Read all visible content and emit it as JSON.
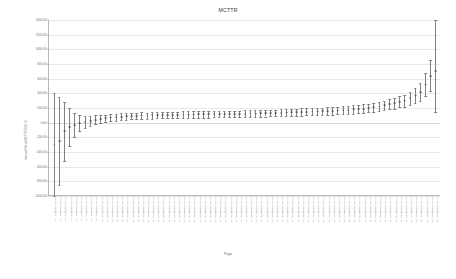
{
  "chart_data": {
    "type": "scatter",
    "title": "MCTTR",
    "xlabel": "Page",
    "ylabel": "Interval Plot of MCTTR 95% CI",
    "ylim": [
      -1000,
      1400
    ],
    "yticks": [
      "1400.00",
      "1200.00",
      "1000.00",
      "800.00",
      "600.00",
      "400.00",
      "200.00",
      "0.00",
      "-200.00",
      "-400.00",
      "-600.00",
      "-800.00",
      "-1000.00"
    ],
    "grid": true,
    "legend": "none",
    "categories": [
      "part 1 assembly station",
      "part 2 assembly station",
      "part 3 assembly station",
      "part 4 assembly station",
      "part 5 assembly station",
      "part 6 assembly station",
      "part 7 assembly station",
      "part 8 assembly station",
      "part 9 assembly station",
      "part 10 assembly station",
      "part 11 assembly station",
      "part 12 assembly station",
      "part 13 assembly station",
      "part 14 assembly station",
      "part 15 assembly station",
      "part 16 assembly station",
      "part 17 assembly station",
      "part 18 assembly station",
      "part 19 assembly station",
      "part 20 assembly station",
      "part 21 assembly station",
      "part 22 assembly station",
      "part 23 assembly station",
      "part 24 assembly station",
      "part 25 assembly station",
      "part 26 assembly station",
      "part 27 assembly station",
      "part 28 assembly station",
      "part 29 assembly station",
      "part 30 assembly station",
      "part 31 assembly station",
      "part 32 assembly station",
      "part 33 assembly station",
      "part 34 assembly station",
      "part 35 assembly station",
      "part 36 assembly station",
      "part 37 assembly station",
      "part 38 assembly station",
      "part 39 assembly station",
      "part 40 assembly station",
      "part 41 assembly station",
      "part 42 assembly station",
      "part 43 assembly station",
      "part 44 assembly station",
      "part 45 assembly station",
      "part 46 assembly station",
      "part 47 assembly station",
      "part 48 assembly station",
      "part 49 assembly station",
      "part 50 assembly station",
      "part 51 assembly station",
      "part 52 assembly station",
      "part 53 assembly station",
      "part 54 assembly station",
      "part 55 assembly station",
      "part 56 assembly station",
      "part 57 assembly station",
      "part 58 assembly station",
      "part 59 assembly station",
      "part 60 assembly station",
      "part 61 assembly station",
      "part 62 assembly station",
      "part 63 assembly station",
      "part 64 assembly station",
      "part 65 assembly station",
      "part 66 assembly station",
      "part 67 assembly station",
      "part 68 assembly station",
      "part 69 assembly station",
      "part 70 assembly station",
      "part 71 assembly station",
      "part 72 assembly station",
      "part 73 assembly station",
      "part 74 assembly station",
      "part 75 assembly station"
    ],
    "values": [
      -300,
      -250,
      -120,
      -60,
      -30,
      -10,
      10,
      25,
      40,
      50,
      60,
      70,
      75,
      80,
      85,
      90,
      90,
      95,
      95,
      100,
      100,
      100,
      105,
      105,
      105,
      110,
      110,
      110,
      112,
      112,
      115,
      115,
      115,
      118,
      118,
      120,
      120,
      122,
      125,
      125,
      128,
      130,
      130,
      132,
      135,
      138,
      140,
      142,
      145,
      148,
      150,
      152,
      155,
      158,
      160,
      165,
      170,
      175,
      180,
      185,
      190,
      200,
      210,
      220,
      235,
      250,
      265,
      285,
      300,
      330,
      370,
      420,
      520,
      640,
      700
    ],
    "lower": [
      -1000,
      -850,
      -520,
      -320,
      -190,
      -120,
      -70,
      -40,
      -20,
      -5,
      10,
      20,
      28,
      34,
      40,
      45,
      46,
      50,
      52,
      56,
      58,
      58,
      62,
      62,
      63,
      66,
      66,
      67,
      68,
      69,
      70,
      71,
      72,
      74,
      74,
      76,
      77,
      78,
      80,
      80,
      82,
      84,
      85,
      86,
      88,
      90,
      92,
      94,
      96,
      98,
      100,
      102,
      104,
      106,
      108,
      112,
      116,
      120,
      124,
      128,
      132,
      140,
      148,
      156,
      168,
      180,
      192,
      208,
      220,
      240,
      270,
      300,
      360,
      430,
      150
    ],
    "upper": [
      400,
      350,
      280,
      200,
      130,
      100,
      90,
      90,
      100,
      105,
      110,
      120,
      122,
      126,
      130,
      135,
      134,
      140,
      138,
      144,
      142,
      142,
      148,
      148,
      147,
      154,
      154,
      153,
      156,
      155,
      160,
      159,
      158,
      162,
      162,
      164,
      163,
      166,
      170,
      170,
      174,
      176,
      175,
      178,
      182,
      186,
      188,
      190,
      194,
      198,
      200,
      202,
      206,
      210,
      212,
      218,
      224,
      230,
      236,
      242,
      248,
      260,
      272,
      284,
      302,
      320,
      338,
      362,
      380,
      420,
      470,
      540,
      680,
      850,
      1400
    ]
  }
}
